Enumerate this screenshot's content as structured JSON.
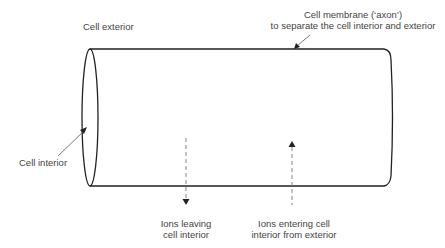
{
  "labels": {
    "cell_exterior": "Cell exterior",
    "cell_membrane_line1": "Cell membrane (‘axon’)",
    "cell_membrane_line2": "to separate the cell interior and exterior",
    "cell_interior": "Cell interior",
    "ions_leaving_line1": "Ions leaving",
    "ions_leaving_line2": "cell interior",
    "ions_entering_line1": "Ions entering cell",
    "ions_entering_line2": "interior from exterior"
  },
  "colors": {
    "outline": "#222222",
    "pointer": "#555555",
    "dashed_arrow": "#777777",
    "text": "#444444"
  }
}
